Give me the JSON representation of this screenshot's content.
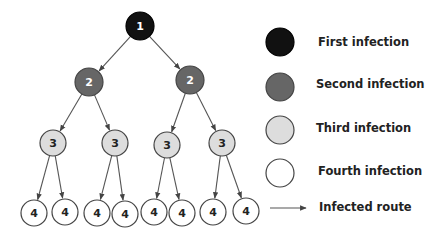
{
  "colors": {
    "first": "#111111",
    "second": "#666666",
    "third": "#dddddd",
    "fourth": "#ffffff",
    "stroke": "#444444",
    "edge": "#555555"
  },
  "tree": {
    "nodes": [
      {
        "id": "n1",
        "label": "1",
        "level": 1,
        "x": 140,
        "y": 26
      },
      {
        "id": "n2a",
        "label": "2",
        "level": 2,
        "x": 89,
        "y": 82
      },
      {
        "id": "n2b",
        "label": "2",
        "level": 2,
        "x": 190,
        "y": 80
      },
      {
        "id": "n3a",
        "label": "3",
        "level": 3,
        "x": 53,
        "y": 143
      },
      {
        "id": "n3b",
        "label": "3",
        "level": 3,
        "x": 115,
        "y": 143
      },
      {
        "id": "n3c",
        "label": "3",
        "level": 3,
        "x": 167,
        "y": 145
      },
      {
        "id": "n3d",
        "label": "3",
        "level": 3,
        "x": 222,
        "y": 143
      },
      {
        "id": "n4a",
        "label": "4",
        "level": 4,
        "x": 34,
        "y": 213
      },
      {
        "id": "n4b",
        "label": "4",
        "level": 4,
        "x": 65,
        "y": 212
      },
      {
        "id": "n4c",
        "label": "4",
        "level": 4,
        "x": 97,
        "y": 213
      },
      {
        "id": "n4d",
        "label": "4",
        "level": 4,
        "x": 125,
        "y": 214
      },
      {
        "id": "n4e",
        "label": "4",
        "level": 4,
        "x": 154,
        "y": 212
      },
      {
        "id": "n4f",
        "label": "4",
        "level": 4,
        "x": 182,
        "y": 213
      },
      {
        "id": "n4g",
        "label": "4",
        "level": 4,
        "x": 213,
        "y": 212
      },
      {
        "id": "n4h",
        "label": "4",
        "level": 4,
        "x": 246,
        "y": 211
      }
    ],
    "edges": [
      [
        "n1",
        "n2a"
      ],
      [
        "n1",
        "n2b"
      ],
      [
        "n2a",
        "n3a"
      ],
      [
        "n2a",
        "n3b"
      ],
      [
        "n2b",
        "n3c"
      ],
      [
        "n2b",
        "n3d"
      ],
      [
        "n3a",
        "n4a"
      ],
      [
        "n3a",
        "n4b"
      ],
      [
        "n3b",
        "n4c"
      ],
      [
        "n3b",
        "n4d"
      ],
      [
        "n3c",
        "n4e"
      ],
      [
        "n3c",
        "n4f"
      ],
      [
        "n3d",
        "n4g"
      ],
      [
        "n3d",
        "n4h"
      ]
    ]
  },
  "legend": {
    "items": [
      {
        "label": "First infection",
        "kind": "first",
        "y": 42
      },
      {
        "label": "Second infection",
        "kind": "second",
        "y": 87
      },
      {
        "label": "Third infection",
        "kind": "third",
        "y": 130
      },
      {
        "label": "Fourth infection",
        "kind": "fourth",
        "y": 173
      },
      {
        "label": "Infected route",
        "kind": "route",
        "y": 208
      }
    ]
  }
}
